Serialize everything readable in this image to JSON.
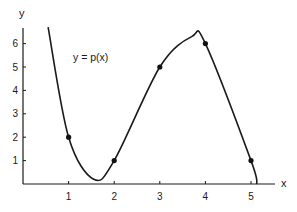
{
  "chart_data": {
    "type": "line",
    "title": "",
    "xlabel": "x",
    "ylabel": "y",
    "xlim": [
      0,
      5.5
    ],
    "ylim": [
      0,
      6.7
    ],
    "grid": false,
    "legend": null,
    "x_ticks": [
      1,
      2,
      3,
      4,
      5
    ],
    "y_ticks": [
      1,
      2,
      3,
      4,
      5,
      6
    ],
    "annotation": "y = p(x)",
    "series": [
      {
        "name": "p(x)",
        "kind": "curve",
        "description": "smooth polynomial passing through the marked points; steep descent from top-left, local minimum near (1.55, 0.2), local maximum near (3.7, 6.3), crosses x-axis near x = 5.13",
        "curve_points": [
          {
            "x": 0.55,
            "y": 6.7
          },
          {
            "x": 1.0,
            "y": 2.0
          },
          {
            "x": 1.55,
            "y": 0.2
          },
          {
            "x": 2.0,
            "y": 1.0
          },
          {
            "x": 3.0,
            "y": 5.0
          },
          {
            "x": 3.7,
            "y": 6.3
          },
          {
            "x": 4.0,
            "y": 6.0
          },
          {
            "x": 5.0,
            "y": 1.0
          },
          {
            "x": 5.13,
            "y": 0.0
          }
        ]
      },
      {
        "name": "data points",
        "kind": "scatter",
        "x": [
          1,
          2,
          3,
          4,
          5
        ],
        "y": [
          2,
          1,
          5,
          6,
          1
        ]
      }
    ]
  },
  "layout": {
    "origin_px": [
      23,
      184
    ],
    "px_per_x": 45.6,
    "px_per_y": 23.4,
    "x_axis_end_px": 275,
    "y_axis_top_px": 28,
    "annotation_px": [
      73,
      61
    ],
    "xlabel_px": [
      281,
      187
    ],
    "ylabel_px": [
      19,
      17
    ]
  }
}
